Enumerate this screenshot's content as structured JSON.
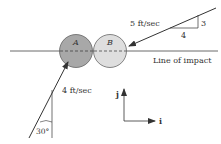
{
  "diagram": {
    "balls": [
      {
        "label": "A",
        "fill": "#a8a8a8"
      },
      {
        "label": "B",
        "fill": "#dedede"
      }
    ],
    "line_label": "Line of impact",
    "velocity_b": {
      "label": "5 ft/sec",
      "slope_rise": "3",
      "slope_run": "4"
    },
    "velocity_a": {
      "label": "4 ft/sec",
      "angle": "30°"
    },
    "axes": {
      "j": "j",
      "i": "i"
    }
  }
}
